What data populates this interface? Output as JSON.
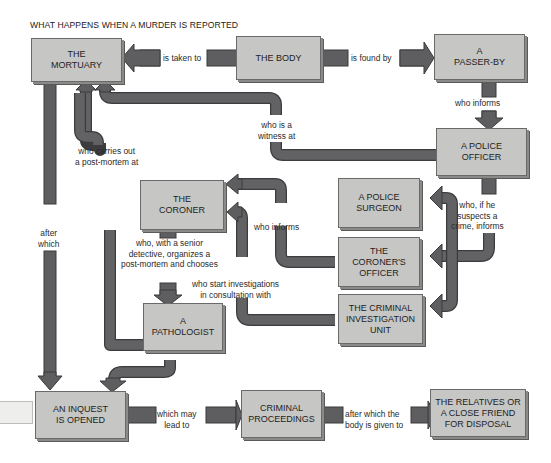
{
  "title": "WHAT HAPPENS WHEN A MURDER IS REPORTED",
  "colors": {
    "node_fill": "#c6c6c4",
    "node_border": "#6a6a6a",
    "connector": "#5f5f61",
    "connector_edge": "#3a3a3c",
    "background": "#ffffff"
  },
  "nodes": {
    "mortuary": "THE\nMORTUARY",
    "body": "THE BODY",
    "passer_by": "A\nPASSER-BY",
    "police_officer": "A POLICE\nOFFICER",
    "coroner": "THE\nCORONER",
    "police_surgeon": "A POLICE\nSURGEON",
    "coroners_officer": "THE\nCORONER'S\nOFFICER",
    "cid": "THE CRIMINAL\nINVESTIGATION\nUNIT",
    "pathologist": "A\nPATHOLOGIST",
    "inquest": "AN INQUEST\nIS OPENED",
    "criminal_proceedings": "CRIMINAL\nPROCEEDINGS",
    "relatives": "THE RELATIVES OR\nA CLOSE FRIEND\nFOR DISPOSAL"
  },
  "edges": {
    "is_taken_to": "is taken to",
    "is_found_by": "is found by",
    "who_informs_1": "who informs",
    "who_is_a_witness_at": "who is a\nwitness at",
    "who_carries_out": "who carries out\na post-mortem at",
    "after_which": "after\nwhich",
    "who_if_he_suspects": "who, if he\nsuspects a\ncrime, informs",
    "who_informs_2": "who informs",
    "who_with_a_senior": "who, with a senior\ndetective, organizes  a\npost-mortem and chooses",
    "who_start_investigations": "who start investigations\nin consultation with",
    "which_may_lead_to": "which may\nlead to",
    "after_which_the_body": "after which the\nbody is given to"
  }
}
